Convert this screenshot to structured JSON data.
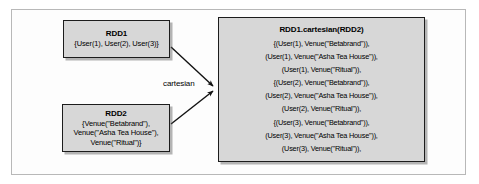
{
  "diagram": {
    "title_alt": "Spark RDD cartesian transformation diagram",
    "nodes": {
      "rdd1": {
        "title": "RDD1",
        "body": "{User(1), User(2), User(3)}"
      },
      "rdd2": {
        "title": "RDD2",
        "body": "{Venue(\"Betabrand\"),\nVenue(\"Asha Tea House\"),\nVenue(\"Ritual\")}"
      },
      "result": {
        "title": "RDD1.cartesian(RDD2)",
        "body": "{(User(1), Venue(\"Betabrand\")),\n(User(1), Venue(\"Asha Tea House\")),\n(User(1), Venue(\"Ritual\")),\n{(User(2), Venue(\"Betabrand\")),\n(User(2), Venue(\"Asha Tea House\")),\n(User(2), Venue(\"Ritual\")),\n{(User(3), Venue(\"Betabrand\")),\n(User(3), Venue(\"Asha Tea House\")),\n(User(3), Venue(\"Ritual\")),"
      }
    },
    "edges": {
      "cartesian_label": "cartesian"
    },
    "colors": {
      "node_fill": "#d7d7d7",
      "node_border": "#1c1c1c",
      "frame_border": "#b8b8b8",
      "text": "#000000",
      "background": "#ffffff"
    }
  }
}
